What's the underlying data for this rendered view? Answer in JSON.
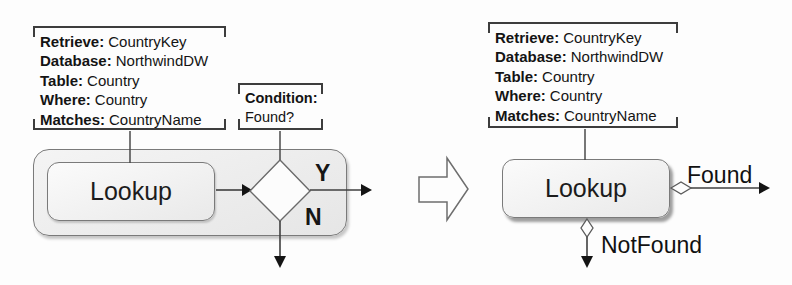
{
  "figure": {
    "left": {
      "annotation": {
        "lines": [
          {
            "k": "Retrieve:",
            "v": "CountryKey"
          },
          {
            "k": "Database:",
            "v": "NorthwindDW"
          },
          {
            "k": "Table:",
            "v": "Country"
          },
          {
            "k": "Where:",
            "v": "Country"
          },
          {
            "k": "Matches:",
            "v": "CountryName"
          }
        ]
      },
      "condition": {
        "k": "Condition:",
        "v": "Found?"
      },
      "lookup_label": "Lookup",
      "yes_label": "Y",
      "no_label": "N"
    },
    "right": {
      "annotation": {
        "lines": [
          {
            "k": "Retrieve:",
            "v": "CountryKey"
          },
          {
            "k": "Database:",
            "v": "NorthwindDW"
          },
          {
            "k": "Table:",
            "v": "Country"
          },
          {
            "k": "Where:",
            "v": "Country"
          },
          {
            "k": "Matches:",
            "v": "CountryName"
          }
        ]
      },
      "lookup_label": "Lookup",
      "found_label": "Found",
      "notfound_label": "NotFound"
    },
    "colors": {
      "line": "#3f3f3f",
      "arrowhead": "#141414",
      "shape_fill": "#ececec",
      "shape_border": "#7a7a7a",
      "background": "#fdfdfd"
    }
  }
}
